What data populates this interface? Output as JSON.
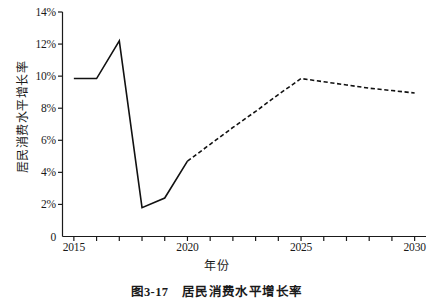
{
  "chart_data": {
    "type": "line",
    "title": "",
    "caption": "图3-17　居民消费水平增长率",
    "xlabel": "年份",
    "ylabel": "居民消费水平增长率",
    "xlim": [
      2014.5,
      2030.5
    ],
    "ylim": [
      0,
      14
    ],
    "grid": false,
    "legend": "none",
    "x_ticks": [
      "2015",
      "2020",
      "2025",
      "2030"
    ],
    "x_tick_values": [
      2015,
      2020,
      2025,
      2030
    ],
    "x_minor_ticks": [
      2016,
      2017,
      2018,
      2019,
      2021,
      2022,
      2023,
      2024,
      2026,
      2027,
      2028,
      2029
    ],
    "y_ticks": [
      "0",
      "2%",
      "4%",
      "6%",
      "8%",
      "10%",
      "12%",
      "14%"
    ],
    "y_tick_values": [
      0,
      2,
      4,
      6,
      8,
      10,
      12,
      14
    ],
    "line_color": "#111111",
    "series": [
      {
        "name": "历史值",
        "style": "solid",
        "x": [
          2015,
          2016,
          2017,
          2018,
          2019,
          2020
        ],
        "values": [
          9.85,
          9.85,
          12.2,
          1.8,
          2.4,
          4.7
        ]
      },
      {
        "name": "预测值",
        "style": "dashed",
        "x": [
          2020,
          2021,
          2022,
          2023,
          2024,
          2025,
          2026,
          2027,
          2028,
          2029,
          2030
        ],
        "values": [
          4.7,
          5.75,
          6.8,
          7.8,
          8.85,
          9.85,
          9.65,
          9.45,
          9.25,
          9.1,
          8.95
        ]
      }
    ]
  }
}
